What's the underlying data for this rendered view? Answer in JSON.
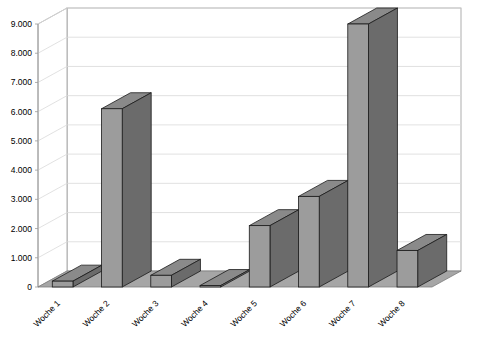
{
  "chart_data": {
    "type": "bar",
    "title": "",
    "subtitle": "",
    "xlabel": "",
    "ylabel": "",
    "categories": [
      "Woche 1",
      "Woche 2",
      "Woche 3",
      "Woche 4",
      "Woche 5",
      "Woche 6",
      "Woche 7",
      "Woche 8"
    ],
    "values": [
      200,
      6100,
      400,
      50,
      2100,
      3100,
      9000,
      1250
    ],
    "series": [
      {
        "name": "",
        "values": [
          200,
          6100,
          400,
          50,
          2100,
          3100,
          9000,
          1250
        ]
      }
    ],
    "ylim": [
      0,
      9000
    ],
    "ytick_values": [
      0,
      1000,
      2000,
      3000,
      4000,
      5000,
      6000,
      7000,
      8000,
      9000
    ],
    "ytick_labels": [
      "0",
      "1.000",
      "2.000",
      "3.000",
      "4.000",
      "5.000",
      "6.000",
      "7.000",
      "8.000",
      "9.000"
    ],
    "grid": true,
    "grid_axis": "y",
    "legend": false,
    "legend_position": "none",
    "style": "3d-column",
    "xtick_rotation_degrees": 45,
    "annotations": []
  },
  "style": {
    "background_color": "#ffffff",
    "plot_wall_color": "#ffffff",
    "floor_color": "#a6a6a6",
    "floor_edge_color": "#7d7d7d",
    "grid_color": "#d9d9d9",
    "axis_color": "#9a9a9a",
    "bar_front_color": "#9c9c9c",
    "bar_side_color": "#6b6b6b",
    "bar_top_color": "#8a8a8a",
    "bar_outline_color": "#1a1a1a",
    "text_color": "#000000"
  },
  "axes": {
    "y_axis_name": "value-axis",
    "x_axis_name": "category-axis"
  }
}
